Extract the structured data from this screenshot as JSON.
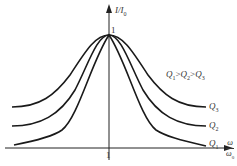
{
  "diagram": {
    "y_axis_label": {
      "base": "I/I",
      "sub": "0"
    },
    "x_axis_label": {
      "numerator": "ω",
      "denominator": "ω",
      "denominator_sub": "0"
    },
    "peak_label": "1",
    "x_tick_label": "1",
    "relation": {
      "q1": "Q",
      "s1": "1",
      "gt1": ">",
      "q2": "Q",
      "s2": "2",
      "gt2": ">",
      "q3": "Q",
      "s3": "3"
    },
    "curves": [
      {
        "name": "Q3",
        "label": "Q",
        "sub": "3"
      },
      {
        "name": "Q2",
        "label": "Q",
        "sub": "2"
      },
      {
        "name": "Q1",
        "label": "Q",
        "sub": "1"
      }
    ],
    "colors": {
      "line": "#1a1a1a",
      "axis": "#222222"
    }
  }
}
